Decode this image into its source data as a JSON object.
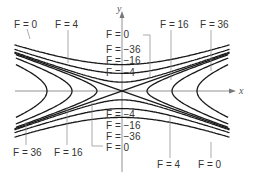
{
  "figure": {
    "type": "level-curves",
    "axes": {
      "x_label": "x",
      "y_label": "y"
    },
    "function_hint": "F = x^2 - y^2",
    "levels_positive": [
      4,
      16,
      36
    ],
    "levels_negative": [
      -4,
      -16,
      -36
    ],
    "level_zero": 0,
    "labels": {
      "top_left_0": "F = 0",
      "top_left_4": "F = 4",
      "top_right_16": "F = 16",
      "top_right_36": "F = 36",
      "center_top": [
        "F = 0",
        "F = −36",
        "F = −16",
        "F = −4"
      ],
      "center_bottom": [
        "F = −4",
        "F = −16",
        "F = −36",
        "F = 0"
      ],
      "bottom_left_36": "F = 36",
      "bottom_left_16": "F = 16",
      "bottom_right_4": "F = 4",
      "bottom_right_0": "F = 0"
    },
    "colors": {
      "curve": "#1a1a1a",
      "axis": "#777777",
      "text": "#333333"
    }
  }
}
